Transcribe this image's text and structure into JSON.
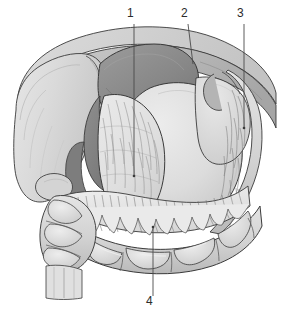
{
  "figure": {
    "type": "grayscale-anatomical-line-illustration",
    "background_color": "#ffffff",
    "outline_color": "#3a3a3a",
    "palette": {
      "liver_light": "#d9d9d9",
      "liver_mid": "#cfcfcf",
      "stomach_dark": "#8d8d8d",
      "stomach_shadow": "#7a7a7a",
      "omentum_light": "#e4e4e4",
      "omentum_fringe": "#ededed",
      "colon_fill": "#d3d3d3",
      "colon_highlight": "#e8e8e8",
      "wall_band": "#c4c4c4",
      "wall_band_dark": "#a8a8a8",
      "intestine_mass": "#dedede",
      "line_stroke": "#3a3a3a",
      "leader_line": "#4a4a4a",
      "label_text": "#2b2b2b"
    }
  },
  "callouts": [
    {
      "id": "callout-1",
      "label": "1",
      "label_x": 129,
      "label_y": 9,
      "line_x1": 134,
      "line_y1": 24,
      "line_x2": 134,
      "line_y2": 176
    },
    {
      "id": "callout-2",
      "label": "2",
      "label_x": 183,
      "label_y": 9,
      "line_x1": 188,
      "line_y1": 24,
      "line_x2": 193,
      "line_y2": 64
    },
    {
      "id": "callout-3",
      "label": "3",
      "label_x": 239,
      "label_y": 9,
      "line_x1": 244,
      "line_y1": 24,
      "line_x2": 244,
      "line_y2": 128
    },
    {
      "id": "callout-4",
      "label": "4",
      "label_x": 148,
      "label_y": 297,
      "line_x1": 153,
      "line_y1": 296,
      "line_x2": 153,
      "line_y2": 227
    }
  ],
  "structures": [
    {
      "name": "abdominal-wall-band",
      "description": "upper arching band of abdominal wall / diaphragm"
    },
    {
      "name": "liver",
      "description": "large pale lobe occupying upper left"
    },
    {
      "name": "stomach",
      "description": "dark gray curved organ beneath the left wall fold"
    },
    {
      "name": "greater-omentum",
      "description": "central fringed apron draping over the intestines"
    },
    {
      "name": "transverse-colon",
      "description": "haustrated colon loop along the lower border"
    },
    {
      "name": "ascending-colon",
      "description": "haustrated colon column at lower left"
    },
    {
      "name": "descending-colon",
      "description": "fringed band on right side"
    },
    {
      "name": "small-intestine-mass",
      "description": "smooth rounded mass in the centre right"
    }
  ]
}
